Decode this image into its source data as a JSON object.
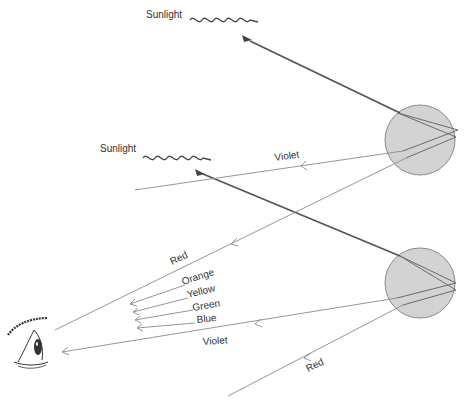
{
  "diagram": {
    "labels": {
      "sunlight_top": "Sunlight",
      "sunlight_mid": "Sunlight",
      "violet_top": "Violet",
      "red_mid": "Red",
      "orange": "Orange",
      "yellow": "Yellow",
      "green": "Green",
      "blue": "Blue",
      "violet_bottom": "Violet",
      "red_bottom": "Red"
    },
    "elements": {
      "drops": [
        {
          "name": "upper-raindrop",
          "cx": 420,
          "cy": 140,
          "r": 35
        },
        {
          "name": "lower-raindrop",
          "cx": 420,
          "cy": 283,
          "r": 35
        }
      ],
      "observer": "eye"
    },
    "colors": {
      "drop_fill": "#d3d3d3",
      "ray": "#8a8a8a",
      "sun_ray": "#555555",
      "text": "#333333"
    }
  }
}
